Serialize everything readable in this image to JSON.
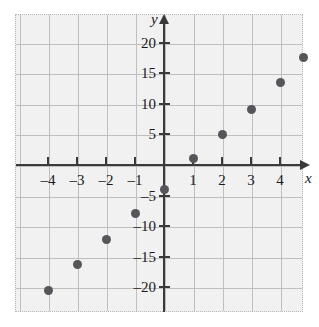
{
  "chart_data": {
    "type": "scatter",
    "title": "",
    "subtitle": "",
    "xlabel": "x",
    "ylabel": "y",
    "xlim": [
      -4.95,
      4.95
    ],
    "ylim": [
      -24.5,
      24
    ],
    "grid": true,
    "legend": null,
    "xticks": [
      -4,
      -3,
      -2,
      -1,
      1,
      2,
      3,
      4
    ],
    "xtick_labels": [
      "–4",
      "–3",
      "–2",
      "–1",
      "1",
      "2",
      "3",
      "4"
    ],
    "yticks": [
      20,
      15,
      10,
      5,
      -5,
      -10,
      -15,
      -20
    ],
    "ytick_labels": [
      "20",
      "15",
      "10",
      "5",
      "–5",
      "–10",
      "–15",
      "–20"
    ],
    "points": [
      {
        "x": -4,
        "y": -20.5
      },
      {
        "x": -3,
        "y": -16.2
      },
      {
        "x": -2,
        "y": -12.1
      },
      {
        "x": -1,
        "y": -8.0
      },
      {
        "x": 0,
        "y": -4.0
      },
      {
        "x": 1,
        "y": 1.0
      },
      {
        "x": 2,
        "y": 5.0
      },
      {
        "x": 3,
        "y": 9.0
      },
      {
        "x": 4,
        "y": 13.4
      },
      {
        "x": 4.8,
        "y": 17.6
      }
    ],
    "colors": {
      "point": "#55555a",
      "axis": "#3a3a3a",
      "grid": "#bfbfbf",
      "plot_background": "#f1f1f1",
      "border": "#b8b8b8"
    }
  }
}
